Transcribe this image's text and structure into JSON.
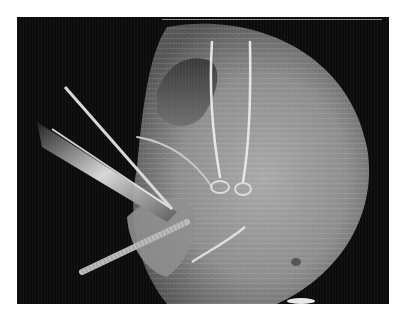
{
  "image": {
    "description": "Grayscale arthroscopic view of a rounded tissue surface with suture strands, knots, and surgical instruments (cannula and probe) entering from the left",
    "colors": {
      "background": "#ffffff",
      "frame": "#0c0c0c",
      "tissue": "#9a9a9a",
      "tissue_highlight": "#c8c8c8",
      "instrument": "#e0e0e0"
    }
  }
}
